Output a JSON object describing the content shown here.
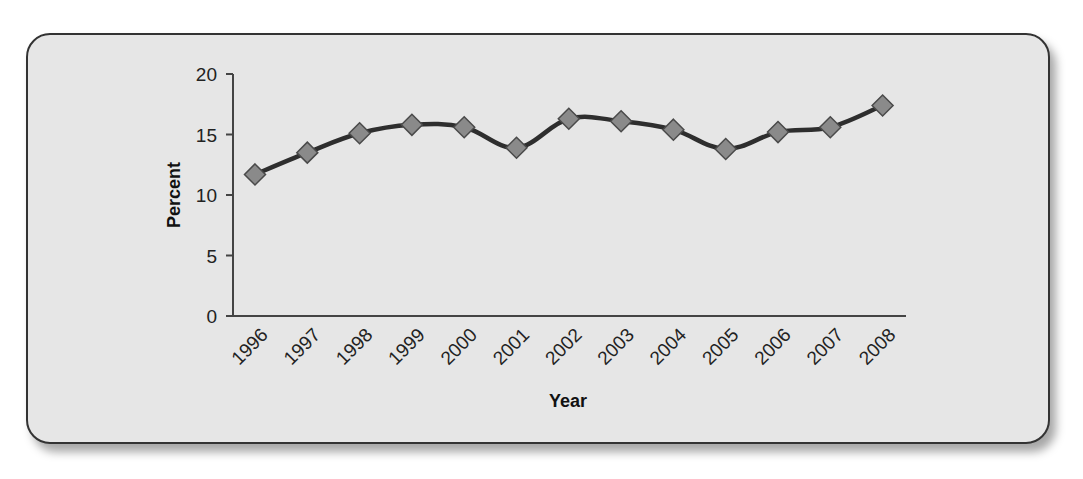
{
  "chart_data": {
    "type": "line",
    "title": "",
    "xlabel": "Year",
    "ylabel": "Percent",
    "categories": [
      "1996",
      "1997",
      "1998",
      "1999",
      "2000",
      "2001",
      "2002",
      "2003",
      "2004",
      "2005",
      "2006",
      "2007",
      "2008"
    ],
    "series": [
      {
        "name": "Percent",
        "values": [
          11.7,
          13.5,
          15.1,
          15.8,
          15.6,
          13.9,
          16.3,
          16.1,
          15.4,
          13.8,
          15.2,
          15.6,
          17.4
        ],
        "marker": "diamond",
        "smooth": true
      }
    ],
    "ylim": [
      0,
      20
    ],
    "yticks": [
      0,
      5,
      10,
      15,
      20
    ],
    "grid": false,
    "legend": "none",
    "x_label_rotation": -45
  },
  "style": {
    "line_color": "#2e2e2e",
    "marker_fill": "#8a8a8a",
    "marker_edge": "#4a4a4a",
    "panel_bg": "#e6e6e6",
    "axis_color": "#444444"
  }
}
